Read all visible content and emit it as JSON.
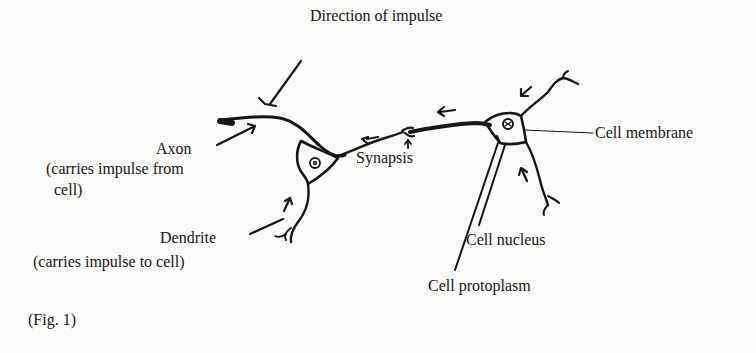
{
  "figure": {
    "caption": "(Fig. 1)",
    "colors": {
      "background": "#fbfbf9",
      "ink": "#161616"
    }
  },
  "labels": {
    "direction": "Direction of impulse",
    "axon": "Axon",
    "axon_desc_line1": "(carries impulse from",
    "axon_desc_line2": "cell)",
    "synapsis": "Synapsis",
    "dendrite": "Dendrite",
    "dendrite_desc": "(carries impulse to cell)",
    "cell_membrane": "Cell membrane",
    "cell_nucleus": "Cell nucleus",
    "cell_protoplasm": "Cell protoplasm"
  }
}
